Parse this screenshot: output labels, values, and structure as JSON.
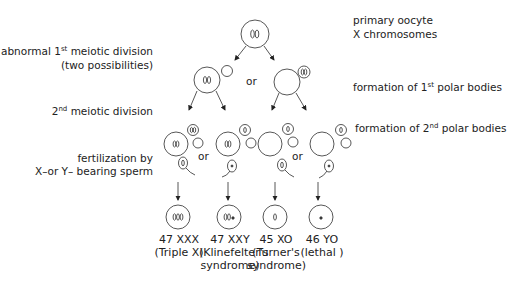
{
  "labels": {
    "primary_oocyte": "primary oocyte",
    "x_chromosomes": "X chromosomes",
    "abnormal_first": {
      "pre": "abnormal 1",
      "sup": "st",
      "post": " meiotic division"
    },
    "two_possibilities": "(two possibilities)",
    "second_division": {
      "pre": "2",
      "sup": "nd",
      "post": "  meiotic division"
    },
    "first_polar": {
      "pre": "formation of 1",
      "sup": "st",
      "post": " polar bodies"
    },
    "second_polar": {
      "pre": "formation of 2",
      "sup": "nd",
      "post": " polar bodies"
    },
    "fertilization_line1": "fertilization by",
    "fertilization_line2": "X–or  Y–  bearing sperm",
    "or": "or"
  },
  "outcomes": [
    {
      "karyotype": "47 XXX",
      "name_line1": "(Triple X)",
      "name_line2": ""
    },
    {
      "karyotype": "47 XXY",
      "name_line1": "(Klinefelter's",
      "name_line2": "syndrome)"
    },
    {
      "karyotype": "45 XO",
      "name_line1": "(Turner's",
      "name_line2": "syndrome)"
    },
    {
      "karyotype": "46 YO",
      "name_line1": "(lethal )",
      "name_line2": ""
    }
  ]
}
